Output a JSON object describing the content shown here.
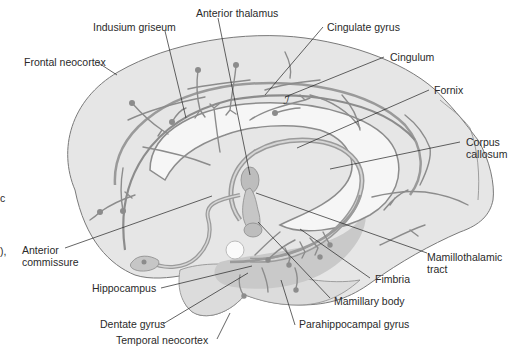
{
  "figure": {
    "colors": {
      "background": "#ffffff",
      "cortex_fill": "#e6e6e6",
      "cortex_outline": "#7a7a7a",
      "inner_region_fill": "#f4f4f4",
      "tract_stroke": "#8c8c8c",
      "tract_fill": "#c8c8c8",
      "deep_structure_fill": "#bdbdbd",
      "leader_line": "#222222",
      "label_text": "#2a2a2a"
    }
  },
  "labels": {
    "frontal_neocortex": "Frontal neocortex",
    "indusium_griseum": "Indusium griseum",
    "anterior_thalamus": "Anterior thalamus",
    "cingulate_gyrus": "Cingulate gyrus",
    "cingulum": "Cingulum",
    "fornix": "Fornix",
    "corpus_callosum_line1": "Corpus",
    "corpus_callosum_line2": "callosum",
    "anterior_commissure_line1": "Anterior",
    "anterior_commissure_line2": "commissure",
    "hippocampus": "Hippocampus",
    "mamillothalamic_tract_line1": "Mamillothalamic",
    "mamillothalamic_tract_line2": "tract",
    "fimbria": "Fimbria",
    "mamillary_body": "Mamillary body",
    "dentate_gyrus": "Dentate gyrus",
    "parahippocampal_gyrus": "Parahippocampal gyrus",
    "temporal_neocortex": "Temporal neocortex",
    "cingulum_glyph": "ℐ"
  },
  "cropped_fragments": {
    "left_edge_1": "c",
    "left_edge_2": "),"
  }
}
